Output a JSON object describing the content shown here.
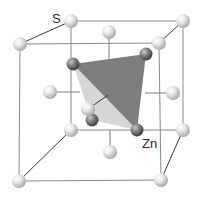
{
  "diagram": {
    "labels": {
      "sulfur": "S",
      "zinc": "Zn"
    },
    "colors": {
      "background": "#ffffff",
      "cube_edge": "#8a8a8a",
      "s_atom_light": "#f4f4f4",
      "s_atom_dark": "#a8a8a8",
      "zn_atom_light": "#b0b0b0",
      "zn_atom_dark": "#4a4a4a",
      "tetra_dark_face": "#7d7d7d",
      "tetra_light_face": "#d6d6d6"
    },
    "s_atoms": [
      {
        "id": "back-top-left",
        "x": 71,
        "y": 21
      },
      {
        "id": "back-top-right",
        "x": 183,
        "y": 21
      },
      {
        "id": "front-top-left",
        "x": 20,
        "y": 44
      },
      {
        "id": "front-top-right",
        "x": 159,
        "y": 43
      },
      {
        "id": "back-bottom-left",
        "x": 71,
        "y": 130
      },
      {
        "id": "back-bottom-right",
        "x": 183,
        "y": 130
      },
      {
        "id": "front-bottom-left",
        "x": 19,
        "y": 181
      },
      {
        "id": "front-bottom-right",
        "x": 161,
        "y": 180
      },
      {
        "id": "face-top",
        "x": 109,
        "y": 32
      },
      {
        "id": "face-bottom",
        "x": 110,
        "y": 152
      },
      {
        "id": "face-left",
        "x": 50,
        "y": 92
      },
      {
        "id": "face-right",
        "x": 173,
        "y": 93
      },
      {
        "id": "face-front",
        "x": 88,
        "y": 109
      }
    ],
    "zn_atoms": [
      {
        "id": "zn-top-left",
        "x": 73,
        "y": 64
      },
      {
        "id": "zn-top-right",
        "x": 146,
        "y": 54
      },
      {
        "id": "zn-bottom-right",
        "x": 137,
        "y": 130
      },
      {
        "id": "zn-center-low",
        "x": 92,
        "y": 120
      }
    ],
    "label_positions": {
      "sulfur": {
        "x": 52,
        "y": 23
      },
      "zinc": {
        "x": 142,
        "y": 147
      }
    }
  }
}
